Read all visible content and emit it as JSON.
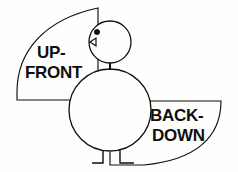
{
  "figure": {
    "background_color": "#fefefd",
    "ink_color": "#100f0d",
    "labels": {
      "upfront": {
        "line1": "UP-",
        "line2": "FRONT"
      },
      "backdown": {
        "line1": "BACK-",
        "line2": "DOWN"
      }
    },
    "parts": {
      "head": "head-circle",
      "eye": "eye-dot",
      "beak": "beak-triangle",
      "neck": "neck-segment",
      "body": "body-circle",
      "left_leg": "left-leg",
      "right_leg": "right-leg",
      "upfront_wedge": "upfront-wedge",
      "backdown_wedge": "backdown-wedge"
    }
  }
}
